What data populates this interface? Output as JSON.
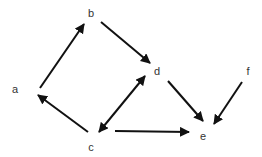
{
  "diagram": {
    "type": "directed-graph",
    "nodes": [
      {
        "id": "a",
        "label": "a",
        "x": 15,
        "y": 93
      },
      {
        "id": "b",
        "label": "b",
        "x": 91,
        "y": 17
      },
      {
        "id": "c",
        "label": "c",
        "x": 91,
        "y": 151
      },
      {
        "id": "d",
        "label": "d",
        "x": 157,
        "y": 75
      },
      {
        "id": "e",
        "label": "e",
        "x": 203,
        "y": 140
      },
      {
        "id": "f",
        "label": "f",
        "x": 248,
        "y": 75
      }
    ],
    "edges": [
      {
        "from": "a",
        "to": "b",
        "x1": 40,
        "y1": 88,
        "x2": 84,
        "y2": 24,
        "bidirectional": false
      },
      {
        "from": "b",
        "to": "d",
        "x1": 101,
        "y1": 22,
        "x2": 150,
        "y2": 63,
        "bidirectional": false
      },
      {
        "from": "c",
        "to": "a",
        "x1": 88,
        "y1": 132,
        "x2": 38,
        "y2": 95,
        "bidirectional": false
      },
      {
        "from": "c",
        "to": "d",
        "x1": 99,
        "y1": 132,
        "x2": 145,
        "y2": 76,
        "bidirectional": true
      },
      {
        "from": "c",
        "to": "e",
        "x1": 115,
        "y1": 131,
        "x2": 189,
        "y2": 132,
        "bidirectional": false
      },
      {
        "from": "d",
        "to": "e",
        "x1": 168,
        "y1": 81,
        "x2": 203,
        "y2": 121,
        "bidirectional": false
      },
      {
        "from": "f",
        "to": "e",
        "x1": 242,
        "y1": 82,
        "x2": 214,
        "y2": 124,
        "bidirectional": false
      }
    ],
    "colors": {
      "edge": "#111111",
      "label": "#333333",
      "background": "#ffffff"
    }
  }
}
